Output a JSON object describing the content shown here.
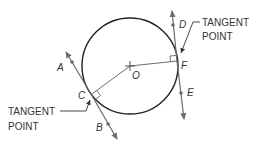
{
  "diagram": {
    "colors": {
      "circle": "#222222",
      "line": "#6b6b6b",
      "text": "#333333",
      "background": "#ffffff"
    },
    "points": {
      "A": "A",
      "B": "B",
      "C": "C",
      "D": "D",
      "E": "E",
      "F": "F",
      "O": "O"
    },
    "callouts": {
      "upper": {
        "line1": "TANGENT",
        "line2": "POINT"
      },
      "lower": {
        "line1": "TANGENT",
        "line2": "POINT"
      }
    }
  }
}
